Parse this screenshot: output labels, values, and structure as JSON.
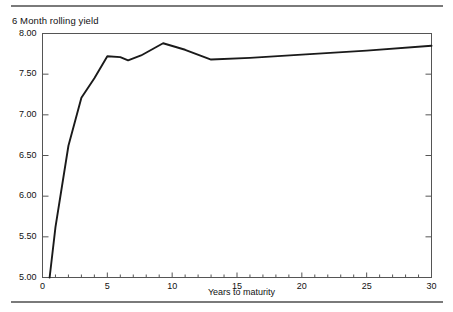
{
  "figure": {
    "background_color": "#ffffff",
    "rule_color": "#7a7a7a",
    "line_color": "#1a1a1a",
    "axis_color": "#555555"
  },
  "chart_data": {
    "type": "line",
    "title": "6 Month rolling yield",
    "xlabel": "Years to maturity",
    "ylabel": "",
    "xlim": [
      0,
      30
    ],
    "ylim": [
      5.0,
      8.0
    ],
    "grid": false,
    "legend": "none",
    "x_ticks": [
      0,
      5,
      10,
      15,
      20,
      25,
      30
    ],
    "x_tick_labels": [
      "0",
      "5",
      "10",
      "15",
      "20",
      "25",
      "30"
    ],
    "x_minor_tick_step": 1,
    "y_ticks": [
      5.0,
      5.5,
      6.0,
      6.5,
      7.0,
      7.5,
      8.0
    ],
    "y_tick_labels": [
      "5.00",
      "5.50",
      "6.00",
      "6.50",
      "7.00",
      "7.50",
      "8.00"
    ],
    "series": [
      {
        "name": "6 Month rolling yield",
        "x": [
          0.55,
          1.0,
          2.0,
          3.0,
          4.0,
          5.0,
          6.0,
          6.6,
          7.6,
          9.3,
          11.0,
          13.0,
          16.0,
          20.0,
          25.0,
          30.0
        ],
        "y": [
          5.0,
          5.62,
          6.62,
          7.21,
          7.45,
          7.72,
          7.71,
          7.67,
          7.73,
          7.88,
          7.8,
          7.68,
          7.7,
          7.74,
          7.79,
          7.85
        ]
      }
    ]
  }
}
